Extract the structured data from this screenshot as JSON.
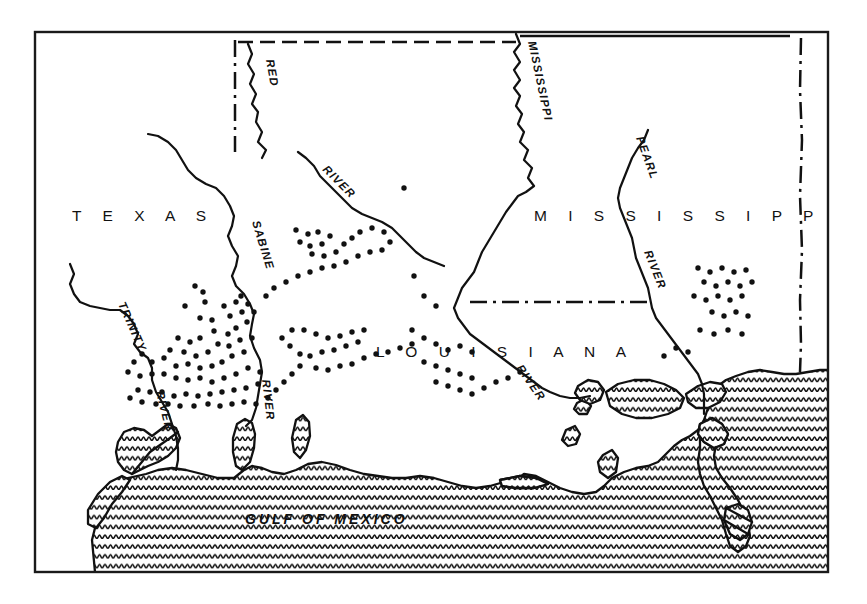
{
  "map": {
    "title": "Gulf Coast states distribution map",
    "frame": {
      "x": 35,
      "y": 32,
      "width": 793,
      "height": 540,
      "stroke": "#1a1a1a"
    },
    "background_color": "#ffffff",
    "ink_color": "#111111",
    "state_labels": [
      {
        "name": "texas-label",
        "text": "T E X A S",
        "x": 72,
        "y": 221
      },
      {
        "name": "louisiana-label",
        "text": "L O U I S I A N A",
        "x": 376,
        "y": 357
      },
      {
        "name": "mississippi-label",
        "text": "M I S S I S S I P P I",
        "x": 534,
        "y": 221
      }
    ],
    "water_labels": [
      {
        "name": "gulf-of-mexico-label",
        "text": "GULF OF MEXICO"
      }
    ],
    "river_labels": [
      {
        "name": "red-river-label",
        "text": "RED"
      },
      {
        "name": "sabine-river-label",
        "text": "SABINE"
      },
      {
        "name": "sabine-river-suffix-label",
        "text": "RIVER"
      },
      {
        "name": "red-river-suffix-label",
        "text": "RIVER"
      },
      {
        "name": "mississippi-river-label",
        "text": "MISSISSIPPI"
      },
      {
        "name": "mississippi-river-suffix-label",
        "text": "RIVER"
      },
      {
        "name": "pearl-river-label",
        "text": "PEARL"
      },
      {
        "name": "pearl-river-suffix-label",
        "text": "RIVER"
      },
      {
        "name": "trinity-river-label",
        "text": "TRINITY"
      },
      {
        "name": "trinity-river-suffix-label",
        "text": "RIVER"
      }
    ],
    "borders": [
      {
        "name": "arkansas-louisiana-border",
        "style": "dashed"
      },
      {
        "name": "texas-louisiana-border",
        "style": "dash-dot"
      },
      {
        "name": "louisiana-mississippi-border",
        "style": "dash-dot"
      },
      {
        "name": "mississippi-alabama-border",
        "style": "dash-dot"
      },
      {
        "name": "arkansas-mississippi-border",
        "style": "solid"
      }
    ],
    "legend": {
      "symbol": "dot",
      "meaning": "occurrence record"
    },
    "dot_count": 178,
    "dots": [
      [
        195,
        286
      ],
      [
        203,
        292
      ],
      [
        185,
        306
      ],
      [
        205,
        302
      ],
      [
        200,
        318
      ],
      [
        212,
        320
      ],
      [
        224,
        306
      ],
      [
        230,
        316
      ],
      [
        236,
        302
      ],
      [
        242,
        312
      ],
      [
        241,
        296
      ],
      [
        248,
        304
      ],
      [
        254,
        312
      ],
      [
        247,
        322
      ],
      [
        236,
        328
      ],
      [
        228,
        334
      ],
      [
        214,
        331
      ],
      [
        200,
        338
      ],
      [
        190,
        342
      ],
      [
        178,
        338
      ],
      [
        170,
        350
      ],
      [
        184,
        352
      ],
      [
        196,
        356
      ],
      [
        208,
        352
      ],
      [
        218,
        344
      ],
      [
        229,
        346
      ],
      [
        240,
        340
      ],
      [
        252,
        338
      ],
      [
        244,
        352
      ],
      [
        232,
        356
      ],
      [
        222,
        362
      ],
      [
        212,
        366
      ],
      [
        200,
        368
      ],
      [
        188,
        364
      ],
      [
        176,
        366
      ],
      [
        164,
        358
      ],
      [
        152,
        362
      ],
      [
        142,
        354
      ],
      [
        134,
        362
      ],
      [
        128,
        372
      ],
      [
        140,
        376
      ],
      [
        152,
        374
      ],
      [
        164,
        374
      ],
      [
        176,
        378
      ],
      [
        188,
        380
      ],
      [
        200,
        378
      ],
      [
        212,
        382
      ],
      [
        224,
        378
      ],
      [
        236,
        374
      ],
      [
        248,
        368
      ],
      [
        260,
        372
      ],
      [
        258,
        384
      ],
      [
        246,
        388
      ],
      [
        234,
        390
      ],
      [
        222,
        392
      ],
      [
        210,
        394
      ],
      [
        198,
        396
      ],
      [
        186,
        394
      ],
      [
        174,
        396
      ],
      [
        162,
        392
      ],
      [
        150,
        392
      ],
      [
        138,
        390
      ],
      [
        130,
        398
      ],
      [
        142,
        402
      ],
      [
        156,
        404
      ],
      [
        168,
        404
      ],
      [
        180,
        406
      ],
      [
        194,
        406
      ],
      [
        208,
        404
      ],
      [
        220,
        406
      ],
      [
        232,
        404
      ],
      [
        244,
        402
      ],
      [
        256,
        404
      ],
      [
        268,
        398
      ],
      [
        276,
        390
      ],
      [
        284,
        382
      ],
      [
        292,
        374
      ],
      [
        300,
        366
      ],
      [
        300,
        354
      ],
      [
        290,
        346
      ],
      [
        282,
        338
      ],
      [
        292,
        330
      ],
      [
        304,
        330
      ],
      [
        316,
        334
      ],
      [
        328,
        338
      ],
      [
        340,
        336
      ],
      [
        352,
        332
      ],
      [
        364,
        330
      ],
      [
        358,
        342
      ],
      [
        346,
        346
      ],
      [
        334,
        350
      ],
      [
        322,
        352
      ],
      [
        310,
        356
      ],
      [
        316,
        368
      ],
      [
        328,
        370
      ],
      [
        340,
        366
      ],
      [
        352,
        364
      ],
      [
        364,
        358
      ],
      [
        376,
        354
      ],
      [
        388,
        352
      ],
      [
        400,
        348
      ],
      [
        412,
        344
      ],
      [
        296,
        230
      ],
      [
        308,
        234
      ],
      [
        318,
        232
      ],
      [
        330,
        236
      ],
      [
        322,
        244
      ],
      [
        310,
        246
      ],
      [
        300,
        242
      ],
      [
        312,
        254
      ],
      [
        324,
        256
      ],
      [
        336,
        252
      ],
      [
        344,
        244
      ],
      [
        352,
        238
      ],
      [
        360,
        232
      ],
      [
        372,
        228
      ],
      [
        384,
        232
      ],
      [
        390,
        242
      ],
      [
        382,
        250
      ],
      [
        370,
        252
      ],
      [
        358,
        256
      ],
      [
        346,
        262
      ],
      [
        334,
        266
      ],
      [
        322,
        268
      ],
      [
        310,
        272
      ],
      [
        298,
        276
      ],
      [
        286,
        282
      ],
      [
        274,
        288
      ],
      [
        266,
        296
      ],
      [
        404,
        188
      ],
      [
        414,
        276
      ],
      [
        424,
        296
      ],
      [
        436,
        306
      ],
      [
        412,
        330
      ],
      [
        424,
        338
      ],
      [
        436,
        344
      ],
      [
        448,
        350
      ],
      [
        460,
        346
      ],
      [
        472,
        352
      ],
      [
        424,
        362
      ],
      [
        436,
        366
      ],
      [
        448,
        370
      ],
      [
        460,
        374
      ],
      [
        472,
        378
      ],
      [
        436,
        382
      ],
      [
        448,
        386
      ],
      [
        460,
        390
      ],
      [
        472,
        394
      ],
      [
        484,
        388
      ],
      [
        496,
        382
      ],
      [
        508,
        378
      ],
      [
        520,
        372
      ],
      [
        698,
        268
      ],
      [
        710,
        272
      ],
      [
        722,
        268
      ],
      [
        734,
        272
      ],
      [
        746,
        270
      ],
      [
        704,
        282
      ],
      [
        716,
        286
      ],
      [
        728,
        282
      ],
      [
        740,
        286
      ],
      [
        752,
        282
      ],
      [
        694,
        296
      ],
      [
        706,
        300
      ],
      [
        718,
        296
      ],
      [
        730,
        300
      ],
      [
        742,
        296
      ],
      [
        712,
        312
      ],
      [
        724,
        316
      ],
      [
        736,
        312
      ],
      [
        748,
        316
      ],
      [
        700,
        330
      ],
      [
        714,
        334
      ],
      [
        728,
        330
      ],
      [
        742,
        334
      ],
      [
        664,
        356
      ],
      [
        676,
        348
      ],
      [
        688,
        352
      ]
    ]
  }
}
